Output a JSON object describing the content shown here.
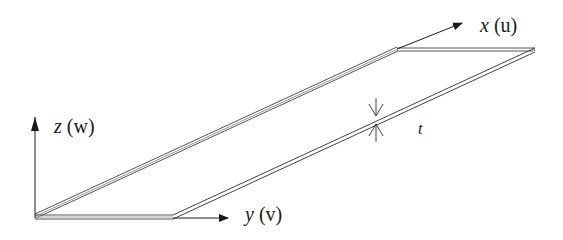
{
  "diagram": {
    "type": "thin plate coordinate system",
    "axes": [
      {
        "id": "x",
        "label": "x",
        "displacement": "u"
      },
      {
        "id": "y",
        "label": "y",
        "displacement": "v"
      },
      {
        "id": "z",
        "label": "z",
        "displacement": "w"
      }
    ],
    "thickness_label": "t",
    "colors": {
      "line": "#333333",
      "fill": "#ffffff",
      "edge_shade": "#9a9a9a"
    }
  },
  "labels": {
    "x_var": "x",
    "x_disp": "(u)",
    "y_var": "y",
    "y_disp": "(v)",
    "z_var": "z",
    "z_disp": "(w)",
    "t": "t"
  }
}
